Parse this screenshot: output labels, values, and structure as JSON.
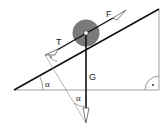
{
  "diagram": {
    "labels": {
      "force_pull": "F",
      "force_tension": "T",
      "force_gravity": "G",
      "angle_incline": "α",
      "angle_triangle": "α",
      "right_angle_marker": "·"
    },
    "colors": {
      "line": "#111111",
      "thin_line": "#666666",
      "ball": "#7a7a7a",
      "background": "#ffffff"
    }
  }
}
